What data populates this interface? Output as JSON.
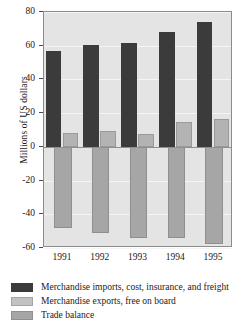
{
  "chart_data": {
    "type": "bar",
    "title": "",
    "xlabel": "",
    "ylabel": "Millions of US dollars",
    "categories": [
      "1991",
      "1992",
      "1993",
      "1994",
      "1995"
    ],
    "ylim": [
      -60,
      80
    ],
    "yticks": [
      80,
      60,
      40,
      20,
      0,
      -20,
      -40,
      -60
    ],
    "ytick_labels": [
      "80",
      "60",
      "40",
      "20",
      "0",
      "-20",
      "-40",
      "-60"
    ],
    "grid": true,
    "legend_position": "below",
    "series": [
      {
        "name": "Merchandise imports, cost, insurance, and freight",
        "color": "#3b3b3b",
        "values": [
          57,
          60.5,
          61.5,
          68,
          74
        ]
      },
      {
        "name": "Merchandise exports, free on board",
        "color": "#c2c2c2",
        "values": [
          8.5,
          9.5,
          7.5,
          14.5,
          16.5
        ]
      },
      {
        "name": "Trade balance",
        "color": "#a6a6a6",
        "values": [
          -48,
          -51,
          -54,
          -54,
          -57.5
        ]
      }
    ]
  },
  "axis": {
    "y_title": "Millions of US dollars"
  }
}
